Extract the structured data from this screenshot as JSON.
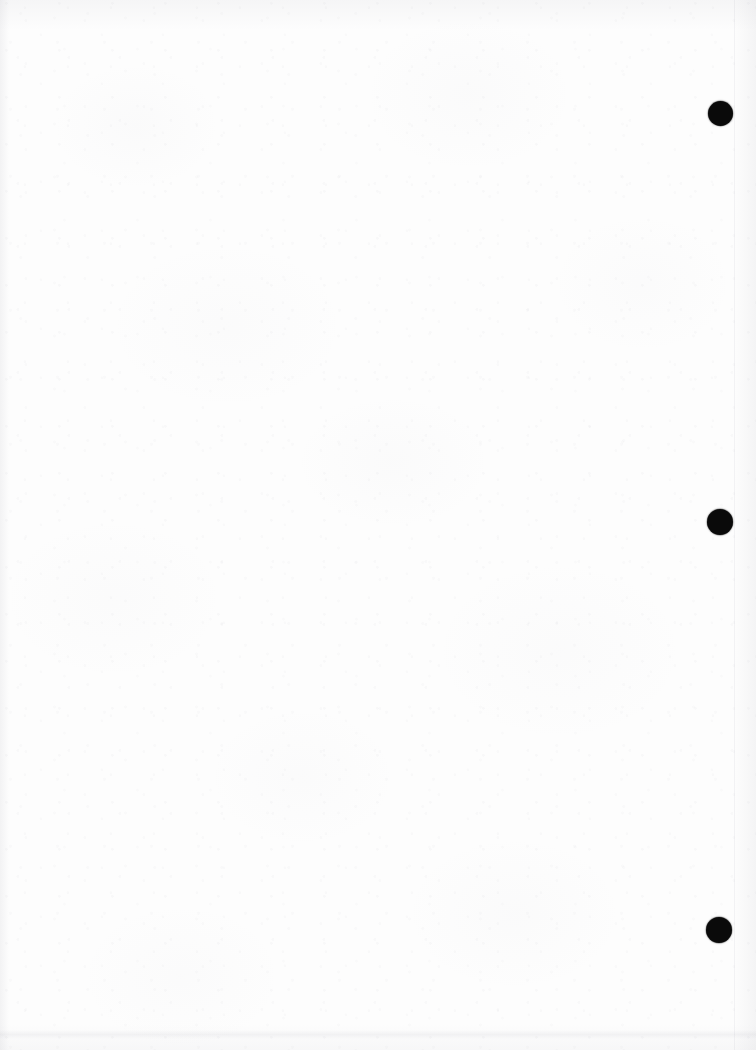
{
  "page": {
    "width": 756,
    "height": 1050,
    "background_color": "#fdfdfd",
    "caption": ""
  },
  "marks": {
    "label": "right-margin registration dots",
    "color": "#0a0a0a",
    "count": 3,
    "dots": [
      {
        "id": "dot-1",
        "cx": 720,
        "cy": 113,
        "diameter": 25,
        "label": ""
      },
      {
        "id": "dot-2",
        "cx": 720,
        "cy": 522,
        "diameter": 26,
        "label": ""
      },
      {
        "id": "dot-3",
        "cx": 719,
        "cy": 930,
        "diameter": 26,
        "label": ""
      }
    ]
  },
  "edges": {
    "left_shadow": true,
    "right_shadow": true,
    "top_shadow": true,
    "bottom_shadow": true,
    "bottom_smudge_band_y": 1030,
    "right_edge_line_x": 734
  }
}
